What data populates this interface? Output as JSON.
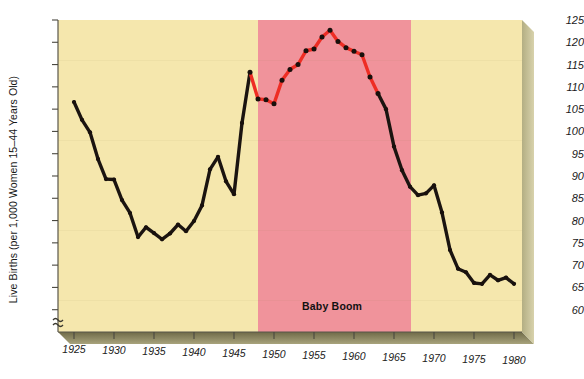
{
  "chart_data": {
    "type": "line",
    "title": "",
    "subtitle": "",
    "xlabel": "",
    "ylabel": "Live Births (per 1,000 Women 15–44 Years Old)",
    "xlim": [
      1923,
      1981
    ],
    "ylim": [
      58,
      125
    ],
    "yticks": [
      60,
      65,
      70,
      75,
      80,
      85,
      90,
      95,
      100,
      105,
      110,
      115,
      120,
      125
    ],
    "xticks": [
      1925,
      1930,
      1935,
      1940,
      1945,
      1950,
      1955,
      1960,
      1965,
      1970,
      1975,
      1980
    ],
    "grid": false,
    "legend": "none",
    "y_axis_break": true,
    "y_axis_break_symbol": "≈",
    "plot_bg_color": "#f5e7ad",
    "highlight_color": "#f0939b",
    "line_color_default": "#1b1410",
    "line_color_highlight": "#ee2d24",
    "marker_color": "#18100c",
    "annotations": [
      {
        "text": "Baby Boom",
        "x": 1956,
        "y": 63,
        "color": "#111111"
      }
    ],
    "highlight_regions": [
      {
        "label": "Baby Boom",
        "x_start": 1946.6,
        "x_end": 1963.9,
        "color": "#f0939b"
      }
    ],
    "series": [
      {
        "name": "Live Births per 1,000 Women 15-44 Years Old",
        "x": [
          1925,
          1926,
          1927,
          1928,
          1929,
          1930,
          1931,
          1932,
          1933,
          1934,
          1935,
          1936,
          1937,
          1938,
          1939,
          1940,
          1941,
          1942,
          1943,
          1944,
          1945,
          1946,
          1947,
          1948,
          1949,
          1950,
          1951,
          1952,
          1953,
          1954,
          1955,
          1956,
          1957,
          1958,
          1959,
          1960,
          1961,
          1962,
          1963,
          1964,
          1965,
          1966,
          1967,
          1968,
          1969,
          1970,
          1971,
          1972,
          1973,
          1974,
          1975,
          1976,
          1977,
          1978,
          1979,
          1980
        ],
        "y": [
          106.6,
          102.6,
          99.8,
          93.8,
          89.3,
          89.2,
          84.6,
          81.7,
          76.3,
          78.5,
          77.2,
          75.8,
          77.1,
          79.1,
          77.6,
          79.9,
          83.4,
          91.5,
          94.3,
          88.8,
          85.9,
          101.9,
          113.3,
          107.3,
          107.1,
          106.2,
          111.5,
          113.9,
          115.0,
          118.1,
          118.5,
          121.2,
          122.7,
          120.2,
          118.8,
          118.0,
          117.2,
          112.2,
          108.5,
          105.0,
          96.6,
          91.3,
          87.6,
          85.7,
          86.1,
          87.9,
          81.8,
          73.4,
          69.2,
          68.4,
          66.0,
          65.8,
          67.8,
          66.6,
          67.2,
          65.8
        ]
      }
    ]
  },
  "yticks_labels": [
    "125",
    "120",
    "115",
    "110",
    "105",
    "100",
    "95",
    "90",
    "85",
    "80",
    "75",
    "70",
    "65",
    "60"
  ],
  "xticks_labels": [
    "1925",
    "1930",
    "1935",
    "1940",
    "1945",
    "1950",
    "1955",
    "1960",
    "1965",
    "1970",
    "1975",
    "1980"
  ]
}
